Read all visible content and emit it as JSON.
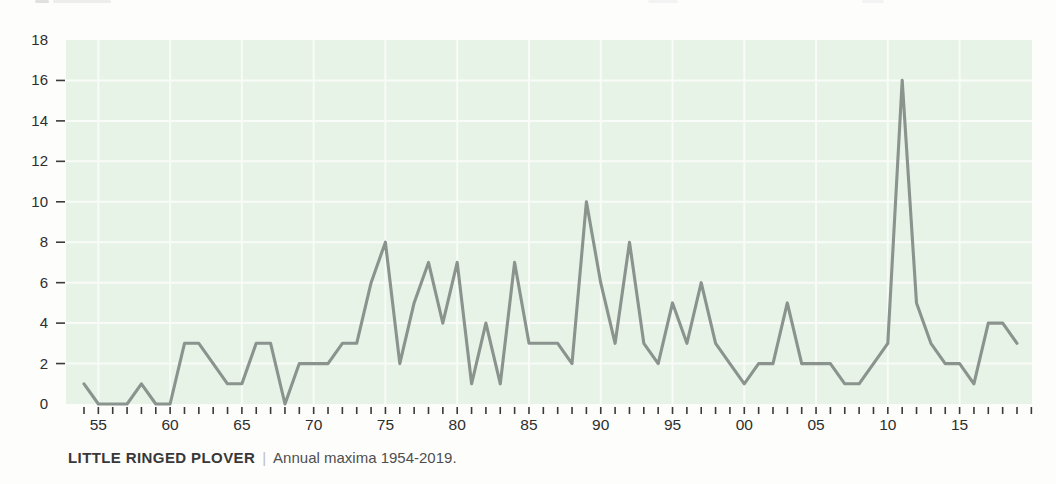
{
  "page": {
    "background": "#fdfdfc"
  },
  "caption": {
    "species": "LITTLE RINGED PLOVER",
    "separator": "|",
    "description": "Annual maxima 1954-2019."
  },
  "chart_data": {
    "type": "line",
    "series_name": "Annual maxima",
    "xlabel": "",
    "ylabel": "",
    "xlim": [
      1954,
      2019
    ],
    "ylim": [
      0,
      18
    ],
    "grid": true,
    "legend": "none",
    "years": [
      1954,
      1955,
      1956,
      1957,
      1958,
      1959,
      1960,
      1961,
      1962,
      1963,
      1964,
      1965,
      1966,
      1967,
      1968,
      1969,
      1970,
      1971,
      1972,
      1973,
      1974,
      1975,
      1976,
      1977,
      1978,
      1979,
      1980,
      1981,
      1982,
      1983,
      1984,
      1985,
      1986,
      1987,
      1988,
      1989,
      1990,
      1991,
      1992,
      1993,
      1994,
      1995,
      1996,
      1997,
      1998,
      1999,
      2000,
      2001,
      2002,
      2003,
      2004,
      2005,
      2006,
      2007,
      2008,
      2009,
      2010,
      2011,
      2012,
      2013,
      2014,
      2015,
      2016,
      2017,
      2018,
      2019
    ],
    "values": [
      1,
      0,
      0,
      0,
      1,
      0,
      0,
      3,
      3,
      2,
      1,
      1,
      3,
      3,
      0,
      2,
      2,
      2,
      3,
      3,
      6,
      8,
      2,
      5,
      7,
      4,
      7,
      1,
      4,
      1,
      7,
      3,
      3,
      3,
      2,
      10,
      6,
      3,
      8,
      3,
      2,
      5,
      3,
      6,
      3,
      2,
      1,
      2,
      2,
      5,
      2,
      2,
      2,
      1,
      1,
      2,
      3,
      16,
      5,
      3,
      2,
      2,
      1,
      4,
      4,
      3
    ],
    "y_ticks": [
      0,
      2,
      4,
      6,
      8,
      10,
      12,
      14,
      16,
      18
    ],
    "x_tick_labels": [
      "55",
      "60",
      "65",
      "70",
      "75",
      "80",
      "85",
      "90",
      "95",
      "00",
      "05",
      "10",
      "15"
    ],
    "x_tick_label_years": [
      1955,
      1960,
      1965,
      1970,
      1975,
      1980,
      1985,
      1990,
      1995,
      2000,
      2005,
      2010,
      2015
    ],
    "colors": {
      "plot_background": "#e7f3e7",
      "gridline": "#f8fbf7",
      "line": "#8a938e",
      "tick": "#3a3a3a",
      "axis_text": "#2e2e2e"
    }
  }
}
